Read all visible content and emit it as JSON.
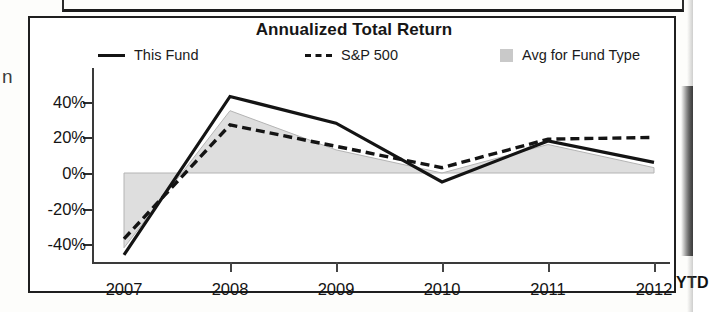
{
  "panel": {
    "title": "Annualized Total Return",
    "ytd_suffix": "YTD",
    "margin_glyph": "n"
  },
  "legend": {
    "items": [
      {
        "label": "This Fund",
        "marker": "solid-line-swatch",
        "color": "#141414"
      },
      {
        "label": "S&P 500",
        "marker": "dashed-line-swatch",
        "color": "#141414"
      },
      {
        "label": "Avg for Fund Type",
        "marker": "gray-area-swatch",
        "color": "#c9c9c9"
      }
    ]
  },
  "axes": {
    "y_ticks": [
      "40%",
      "20%",
      "0%",
      "-20%",
      "-40%"
    ],
    "x_ticks": [
      "2007",
      "2008",
      "2009",
      "2010",
      "2011",
      "2012"
    ]
  },
  "chart_data": {
    "type": "line",
    "title": "Annualized Total Return",
    "xlabel": "",
    "ylabel": "",
    "categories": [
      "2007",
      "2008",
      "2009",
      "2010",
      "2011",
      "2012"
    ],
    "x_note": "last category is 2012 YTD",
    "ylim": [
      -50,
      50
    ],
    "yticks": [
      -40,
      -20,
      0,
      20,
      40
    ],
    "ytick_labels": [
      "-40%",
      "-20%",
      "0%",
      "20%",
      "40%"
    ],
    "grid": false,
    "legend_position": "top",
    "series": [
      {
        "name": "This Fund",
        "style": "solid",
        "color": "#141414",
        "values": [
          -46,
          43,
          28,
          -5,
          18,
          6
        ]
      },
      {
        "name": "S&P 500",
        "style": "dashed",
        "color": "#141414",
        "values": [
          -37,
          27,
          15,
          3,
          19,
          20
        ]
      },
      {
        "name": "Avg for Fund Type",
        "style": "area",
        "color": "#c9c9c9",
        "values": [
          -42,
          35,
          13,
          0,
          16,
          3
        ]
      }
    ]
  }
}
